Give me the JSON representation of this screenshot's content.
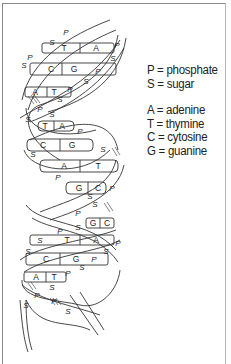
{
  "diagram": {
    "strand_labels": {
      "phosphate": "P",
      "sugar": "S"
    },
    "base_pairs": [
      {
        "left": "T",
        "right": "A"
      },
      {
        "left": "C",
        "right": "G"
      },
      {
        "left": "A",
        "right": "T"
      },
      {
        "left": "T",
        "right": "A"
      },
      {
        "left": "C",
        "right": "G"
      },
      {
        "left": "A",
        "right": "T"
      },
      {
        "left": "G",
        "right": "C"
      },
      {
        "left": "G",
        "right": "C"
      },
      {
        "left": "T",
        "right": "A"
      },
      {
        "left": "C",
        "right": "G"
      },
      {
        "left": "A",
        "right": "T"
      }
    ],
    "colors": {
      "line": "#333333",
      "background": "#ffffff",
      "frame": "#8a8a8a"
    }
  },
  "legend": {
    "strand_items": [
      {
        "key": "P",
        "text": "P = phosphate"
      },
      {
        "key": "S",
        "text": "S = sugar"
      }
    ],
    "base_items": [
      {
        "key": "A",
        "text": "A = adenine"
      },
      {
        "key": "T",
        "text": "T = thymine"
      },
      {
        "key": "C",
        "text": "C = cytosine"
      },
      {
        "key": "G",
        "text": "G = guanine"
      }
    ]
  }
}
